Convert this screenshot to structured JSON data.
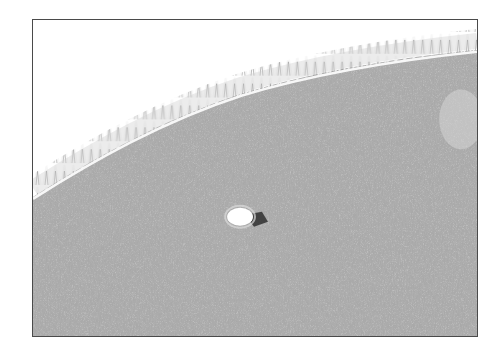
{
  "image": {
    "subject": "knit fabric with overlock edge stitching and a small hole",
    "tone": "grayscale",
    "colors": {
      "background": "#ffffff",
      "frame_border": "#4a4a4a",
      "fabric": "#a9a9a9",
      "fabric_dark": "#8f8f8f",
      "fabric_light": "#c2c2c2",
      "stitch": "#f4f4f4",
      "hole": "#ffffff",
      "hole_shadow": "#3c3c3c"
    }
  }
}
